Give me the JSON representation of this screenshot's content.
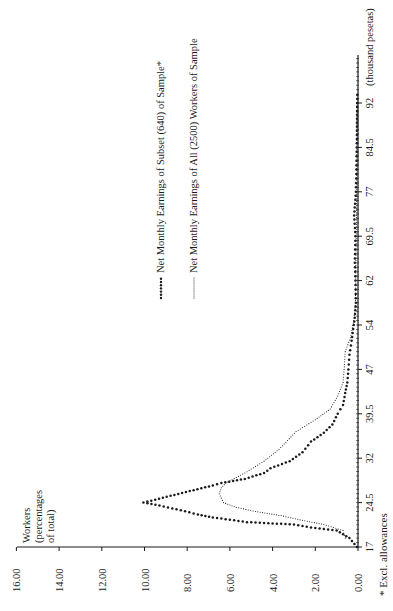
{
  "chart_data": {
    "type": "line",
    "orientation": "rotated 90 degrees counter-clockwise (x-axis runs bottom-to-top, y-axis runs right-to-left)",
    "title": "",
    "xlabel": "(thousand pesetas)",
    "ylabel": "Workers (percentages of total)",
    "ylabel_lines": [
      "Workers",
      "(percentages",
      "of total)"
    ],
    "x_ticks": [
      "17",
      "24.5",
      "32",
      "39.5",
      "47",
      "54",
      "62",
      "69.5",
      "77",
      "84.5",
      "92"
    ],
    "x_tick_values": [
      17,
      24.5,
      32,
      39.5,
      47,
      54,
      62,
      69.5,
      77,
      84.5,
      92
    ],
    "y_ticks": [
      "0.00",
      "2.00",
      "4.00",
      "6.00",
      "8.00",
      "10.00",
      "12.00",
      "14.00",
      "16.00"
    ],
    "ylim": [
      0,
      16
    ],
    "xlim": [
      17,
      94
    ],
    "grid": false,
    "legend_position": "upper area, beside the curves",
    "footnote": "* Excl. allowances",
    "series": [
      {
        "name": "Net Monthly Earnings of Subset (640) of Sample*",
        "style": "bold dotted",
        "x": [
          17,
          18.5,
          19.8,
          20.3,
          20.8,
          21.2,
          21.6,
          22.0,
          22.5,
          23.2,
          24.0,
          24.5,
          25.0,
          25.8,
          26.6,
          27.4,
          27.8,
          28.5,
          29.5,
          30.3,
          31.5,
          33.0,
          34.8,
          36.3,
          37.7,
          39.5,
          41.0,
          43.0,
          44.8,
          47.0,
          49.3,
          51.5,
          54.0,
          55.3,
          58.0,
          62.0,
          65.0,
          69.5,
          73.0,
          77.0,
          80.0,
          84.5,
          88.0,
          92.0,
          94.0
        ],
        "y": [
          0.05,
          0.4,
          1.0,
          2.2,
          3.0,
          5.2,
          6.0,
          6.8,
          7.5,
          8.3,
          9.3,
          10.05,
          9.5,
          8.6,
          7.7,
          6.8,
          6.4,
          5.3,
          4.4,
          4.1,
          3.2,
          2.6,
          2.2,
          1.6,
          1.2,
          0.95,
          0.7,
          0.6,
          0.5,
          0.45,
          0.4,
          0.3,
          0.2,
          0.15,
          0.1,
          0.12,
          0.15,
          0.12,
          0.18,
          0.1,
          0.08,
          0.06,
          0.05,
          0.04,
          0.03
        ]
      },
      {
        "name": "Net Monthly Earnings of All (2500) Workers of Sample",
        "style": "fine dotted",
        "x": [
          18.5,
          19.8,
          20.8,
          21.5,
          22.3,
          23.0,
          23.7,
          24.5,
          26.0,
          27.0,
          27.8,
          29.5,
          31.5,
          33.5,
          36.5,
          38.5,
          40.3,
          42.5,
          44.8,
          47.0,
          49.8,
          52.0,
          54.8,
          58.0,
          62.0,
          65.0,
          69.5,
          77.0,
          84.5,
          92.0
        ],
        "y": [
          0.6,
          0.7,
          1.6,
          2.6,
          3.6,
          4.8,
          5.7,
          6.3,
          6.5,
          6.4,
          6.2,
          5.3,
          4.4,
          3.7,
          2.9,
          2.0,
          1.3,
          0.95,
          0.7,
          0.65,
          0.6,
          0.35,
          0.2,
          0.12,
          0.1,
          0.1,
          0.08,
          0.06,
          0.05,
          0.04
        ]
      }
    ]
  },
  "legend": {
    "items": [
      {
        "label": "Net Monthly Earnings of Subset (640) of Sample*",
        "marker": "bold-dots"
      },
      {
        "label": "Net Monthly Earnings of All (2500) Workers of Sample",
        "marker": "fine-dots"
      }
    ]
  },
  "colors": {
    "ink": "#1a1a1a",
    "background": "#ffffff"
  }
}
